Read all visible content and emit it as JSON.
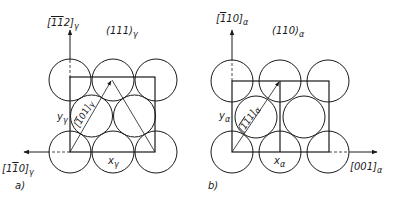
{
  "panels": [
    {
      "id": "a",
      "label": "a)",
      "plane": "(111)",
      "plane_sub": "γ",
      "vertical_axis": "[112]",
      "vertical_axis_overbars": "11",
      "vertical_axis_sub": "γ",
      "horizontal_axis": "[110]",
      "horizontal_axis_sub": "γ",
      "diagonal_direction": "[101]",
      "diagonal_sub": "γ",
      "x_label": "x",
      "x_sub": "γ",
      "y_label": "y",
      "y_sub": "γ"
    },
    {
      "id": "b",
      "label": "b)",
      "plane": "(110)",
      "plane_sub": "α",
      "vertical_axis": "[110]",
      "vertical_axis_sub": "α",
      "horizontal_axis": "[001]",
      "horizontal_axis_sub": "α",
      "diagonal_direction": "[111]",
      "diagonal_sub": "α",
      "x_label": "x",
      "x_sub": "α",
      "y_label": "y",
      "y_sub": "α"
    }
  ],
  "colors": {
    "line": "#1a1a1a",
    "background": "#ffffff"
  }
}
